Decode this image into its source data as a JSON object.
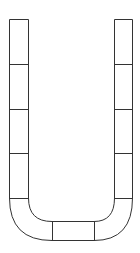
{
  "diagram": {
    "type": "u-shaped-segmented-track",
    "stroke_color": "#333333",
    "background_color": "#ffffff",
    "left_column": {
      "segments": 5
    },
    "right_column": {
      "segments": 5
    },
    "bottom_curve": {
      "segments": 3
    }
  }
}
